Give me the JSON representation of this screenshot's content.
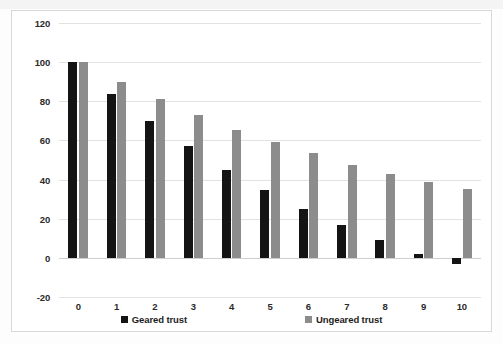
{
  "chart_data": {
    "type": "bar",
    "title": "",
    "subtitle": "",
    "xlabel": "",
    "ylabel": "",
    "categories": [
      "0",
      "1",
      "2",
      "3",
      "4",
      "5",
      "6",
      "7",
      "8",
      "9",
      "10"
    ],
    "series": [
      {
        "name": "Geared trust",
        "color": "#141414",
        "values": [
          100,
          84,
          70,
          57,
          45,
          34.5,
          25,
          17,
          9,
          2,
          -3
        ]
      },
      {
        "name": "Ungeared trust",
        "color": "#8c8c8c",
        "values": [
          100,
          90,
          81,
          73,
          65.5,
          59,
          53.5,
          47.5,
          43,
          39,
          35
        ]
      }
    ],
    "ylim": [
      -20,
      120
    ],
    "ytick_values": [
      120,
      100,
      80,
      60,
      40,
      20,
      0,
      -20
    ],
    "ytick_labels": [
      "120",
      "100",
      "80",
      "60",
      "40",
      "20",
      "0",
      "-20"
    ],
    "grid": true,
    "legend_position": "bottom",
    "legend_entries": [
      "Geared trust",
      "Ungeared trust"
    ]
  }
}
